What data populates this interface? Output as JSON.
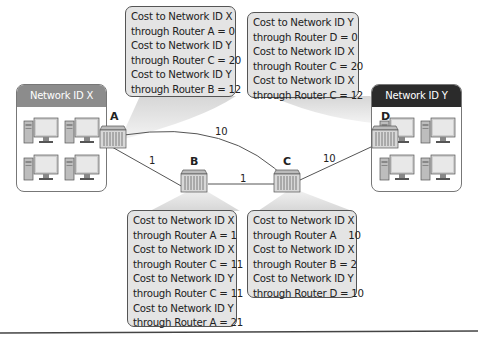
{
  "networks": {
    "x": {
      "label": "Network ID X",
      "header_color": "#8c8c8c"
    },
    "y": {
      "label": "Network ID Y",
      "header_color": "#2b2b2b"
    }
  },
  "routers": {
    "a": {
      "label": "A"
    },
    "b": {
      "label": "B"
    },
    "c": {
      "label": "C"
    },
    "d": {
      "label": "D"
    }
  },
  "links": {
    "a_c": "10",
    "a_b": "1",
    "b_c": "1",
    "c_d": "10"
  },
  "tables": {
    "a": [
      "Cost to Network ID X",
      "through Router A = 0",
      "Cost to Network ID Y",
      "through Router C = 20",
      "Cost to Network ID Y",
      "through Router B = 12"
    ],
    "d": [
      "Cost to Network ID Y",
      "through Router D = 0",
      "Cost to Network ID X",
      "through Router C = 20",
      "Cost to Network ID X",
      "through Router C = 12"
    ],
    "b": [
      "Cost to Network ID X",
      "through Router A = 1",
      "Cost to Network ID X",
      "through Router C = 11",
      "Cost to Network ID Y",
      "through Router C = 11",
      "Cost to Network ID Y",
      "through Router A = 21"
    ],
    "c": [
      "Cost to Network ID X",
      "through Router A    10",
      "Cost to Network ID X",
      "through Router B = 2",
      "Cost to Network ID Y",
      "through Router D = 10"
    ]
  }
}
